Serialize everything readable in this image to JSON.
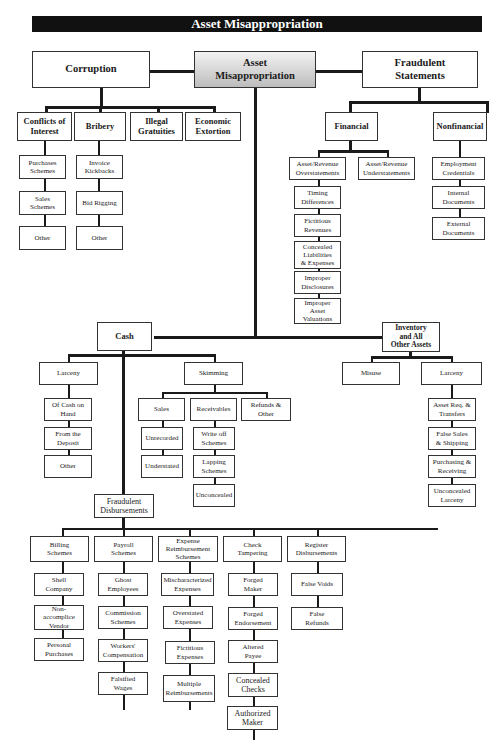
{
  "title": "Asset Misappropriation",
  "top": {
    "corruption": "Corruption",
    "asset_misappropriation": "Asset\nMisappropriation",
    "fraudulent_statements": "Fraudulent\nStatements"
  },
  "corruption": {
    "conflicts": "Conflicts of\nInterest",
    "bribery": "Bribery",
    "illegal_gratuities": "Illegal\nGratuities",
    "economic_extortion": "Economic\nExtortion",
    "conflicts_items": [
      "Purchases\nSchemes",
      "Sales\nSchemes",
      "Other"
    ],
    "bribery_items": [
      "Invoice\nKickbacks",
      "Bid Rigging",
      "Other"
    ]
  },
  "statements": {
    "financial": "Financial",
    "nonfinancial": "Nonfinancial",
    "overstatements": "Asset/Revenue\nOverstatements",
    "understatements": "Asset/Revenue\nUnderstatements",
    "over_items": [
      "Timing\nDifferences",
      "Fictitious\nRevenues",
      "Concealed\nLiabilities\n& Expenses",
      "Improper\nDisclosures",
      "Improper\nAsset\nValuations"
    ],
    "nonfin_items": [
      "Employment\nCredentials",
      "Internal\nDocuments",
      "External\nDocuments"
    ]
  },
  "cash": {
    "label": "Cash",
    "larceny": "Larceny",
    "larceny_items": [
      "Of Cash on\nHand",
      "From the\nDeposit",
      "Other"
    ],
    "skimming": "Skimming",
    "sales": "Sales",
    "sales_items": [
      "Unrecorded",
      "Understated"
    ],
    "receivables": "Receivables",
    "receivables_items": [
      "Write off\nSchemes",
      "Lapping\nSchemes",
      "Unconcealed"
    ],
    "refunds": "Refunds &\nOther"
  },
  "inventory": {
    "label": "Inventory\nand All\nOther Assets",
    "misuse": "Misuse",
    "larceny": "Larceny",
    "larceny_items": [
      "Asset Req. &\nTransfers",
      "False Sales\n& Shipping",
      "Purchasing &\nReceiving",
      "Unconcealed\nLarceny"
    ]
  },
  "disbursements": {
    "label": "Fraudulent\nDisbursements",
    "billing": "Billing\nSchemes",
    "billing_items": [
      "Shell\nCompany",
      "Non-\naccomplice\nVendor",
      "Personal\nPurchases"
    ],
    "payroll": "Payroll\nSchemes",
    "payroll_items": [
      "Ghost\nEmployees",
      "Commission\nSchemes",
      "Workers'\nCompensation",
      "Falsified\nWages"
    ],
    "expense": "Expense\nReimbursement\nSchemes",
    "expense_items": [
      "Mischaracterized\nExpenses",
      "Overstated\nExpenses",
      "Fictitious\nExpenses",
      "Multiple\nReimbursements"
    ],
    "check": "Check\nTampering",
    "check_items": [
      "Forged\nMaker",
      "Forged\nEndorsement",
      "Altered\nPayee",
      "Concealed\nChecks",
      "Authorized\nMaker"
    ],
    "register": "Register\nDisbursements",
    "register_items": [
      "False Voids",
      "False\nRefunds"
    ]
  }
}
